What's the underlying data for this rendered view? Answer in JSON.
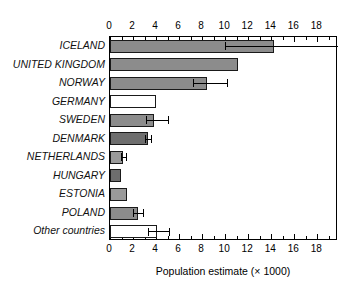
{
  "chart_data": {
    "type": "bar",
    "orientation": "horizontal",
    "title": "",
    "xlabel": "Population estimate (× 1000)",
    "ylabel": "",
    "xlim": [
      0,
      19.8
    ],
    "xticks": [
      0,
      2,
      4,
      6,
      8,
      10,
      12,
      14,
      16,
      18
    ],
    "xtick_labels": [
      "0",
      "2",
      "4",
      "6",
      "8",
      "10",
      "12",
      "14",
      "16",
      "18"
    ],
    "minor_tick_step": 1,
    "grid": false,
    "legend": null,
    "axis_ticks_position": "both top and bottom",
    "categories": [
      "ICELAND",
      "UNITED KINGDOM",
      "NORWAY",
      "GERMANY",
      "SWEDEN",
      "DENMARK",
      "NETHERLANDS",
      "HUNGARY",
      "ESTONIA",
      "POLAND",
      "Other countries"
    ],
    "values": [
      14.2,
      11.1,
      8.4,
      4.0,
      3.85,
      3.3,
      1.1,
      0.95,
      1.5,
      2.4,
      4.1
    ],
    "error_low": [
      10.0,
      null,
      7.2,
      null,
      3.1,
      3.0,
      0.95,
      null,
      null,
      2.0,
      3.3
    ],
    "error_high": [
      19.8,
      null,
      10.2,
      null,
      5.0,
      3.6,
      1.4,
      null,
      null,
      2.9,
      5.1
    ],
    "bars": [
      {
        "category": "ICELAND",
        "value": 14.2,
        "fill": "#8c8c8c",
        "err_low": 10.0,
        "err_high": 19.8
      },
      {
        "category": "UNITED KINGDOM",
        "value": 11.1,
        "fill": "#8c8c8c",
        "err_low": null,
        "err_high": null
      },
      {
        "category": "NORWAY",
        "value": 8.4,
        "fill": "#8c8c8c",
        "err_low": 7.2,
        "err_high": 10.2
      },
      {
        "category": "GERMANY",
        "value": 4.0,
        "fill": "#ffffff",
        "err_low": null,
        "err_high": null
      },
      {
        "category": "SWEDEN",
        "value": 3.85,
        "fill": "#8c8c8c",
        "err_low": 3.1,
        "err_high": 5.0
      },
      {
        "category": "DENMARK",
        "value": 3.3,
        "fill": "#6e6e6e",
        "err_low": 3.0,
        "err_high": 3.6
      },
      {
        "category": "NETHERLANDS",
        "value": 1.1,
        "fill": "#9a9a9a",
        "err_low": 0.95,
        "err_high": 1.4
      },
      {
        "category": "HUNGARY",
        "value": 0.95,
        "fill": "#6e6e6e",
        "err_low": null,
        "err_high": null
      },
      {
        "category": "ESTONIA",
        "value": 1.5,
        "fill": "#9a9a9a",
        "err_low": null,
        "err_high": null
      },
      {
        "category": "POLAND",
        "value": 2.4,
        "fill": "#8c8c8c",
        "err_low": 2.0,
        "err_high": 2.9
      },
      {
        "category": "Other countries",
        "value": 4.1,
        "fill": "#ffffff",
        "err_low": 3.3,
        "err_high": 5.1
      }
    ]
  },
  "colors": {
    "axis": "#000000",
    "bar_medium_gray": "#8c8c8c",
    "bar_light_gray": "#9a9a9a",
    "bar_dark_gray": "#6e6e6e",
    "bar_white": "#ffffff",
    "background": "#ffffff"
  }
}
